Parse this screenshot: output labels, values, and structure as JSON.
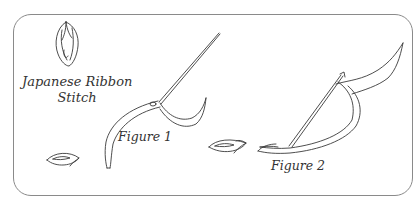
{
  "title": {
    "line1": "Japanese Ribbon",
    "line2": "Stitch"
  },
  "figures": [
    {
      "label": "Figure 1"
    },
    {
      "label": "Figure 2"
    }
  ],
  "colors": {
    "line": "#3a3a3a",
    "frame": "#8a8a8a",
    "text": "#333333",
    "background": "#ffffff"
  }
}
